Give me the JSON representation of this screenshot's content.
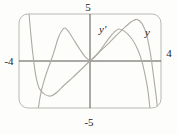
{
  "figure": {
    "viewing_window_text": {
      "top": "5",
      "bottom": "-5",
      "left": "-4",
      "right": "4"
    }
  },
  "chart_data": {
    "type": "line",
    "title": "",
    "xlabel": "",
    "ylabel": "",
    "window": {
      "xmin": -4,
      "xmax": 4,
      "ymin": -5,
      "ymax": 5
    },
    "grid": false,
    "legend_position": "inline-curve-labels",
    "axis_labels": {
      "top": "5",
      "bottom": "-5",
      "left": "-4",
      "right": "4"
    },
    "plot_px": {
      "left": 19,
      "top": 14,
      "right": 161,
      "bottom": 108,
      "radius": 9
    },
    "series": [
      {
        "name": "y",
        "label": "y",
        "role": "function",
        "features": "local minimum near (-2.2,-3.7), flat inflection at origin, local maximum near (2.65,4.4), steep fall at both window edges",
        "points": [
          [
            -3.45,
            5.4
          ],
          [
            -3.34,
            3.0
          ],
          [
            -3.22,
            0.8
          ],
          [
            -3.06,
            -1.5
          ],
          [
            -2.86,
            -2.9
          ],
          [
            -2.55,
            -3.55
          ],
          [
            -2.2,
            -3.72
          ],
          [
            -1.85,
            -3.3
          ],
          [
            -1.45,
            -2.55
          ],
          [
            -1.0,
            -1.8
          ],
          [
            -0.5,
            -0.9
          ],
          [
            0,
            0
          ],
          [
            0.5,
            0.9
          ],
          [
            1.0,
            1.8
          ],
          [
            1.5,
            2.75
          ],
          [
            2.0,
            3.65
          ],
          [
            2.35,
            4.2
          ],
          [
            2.65,
            4.42
          ],
          [
            2.95,
            3.9
          ],
          [
            3.2,
            2.7
          ],
          [
            3.42,
            0.6
          ],
          [
            3.58,
            -1.6
          ],
          [
            3.72,
            -3.6
          ],
          [
            3.82,
            -5.4
          ]
        ]
      },
      {
        "name": "y-prime",
        "label": "y'",
        "role": "derivative",
        "features": "zero at x=-2.2, local max near (-1.4,3.5), dip to ~0 at origin, local max near (1.6,3.4), zero near x=2.9, steep fall right side",
        "points": [
          [
            -2.94,
            -5.4
          ],
          [
            -2.8,
            -3.7
          ],
          [
            -2.62,
            -2.3
          ],
          [
            -2.4,
            -1.0
          ],
          [
            -2.2,
            0
          ],
          [
            -2.0,
            1.15
          ],
          [
            -1.78,
            2.5
          ],
          [
            -1.56,
            3.3
          ],
          [
            -1.4,
            3.5
          ],
          [
            -1.18,
            3.05
          ],
          [
            -0.88,
            2.15
          ],
          [
            -0.56,
            1.2
          ],
          [
            -0.26,
            0.42
          ],
          [
            0,
            0.1
          ],
          [
            0.3,
            0.5
          ],
          [
            0.64,
            1.3
          ],
          [
            1.0,
            2.25
          ],
          [
            1.35,
            3.05
          ],
          [
            1.62,
            3.4
          ],
          [
            1.95,
            3.15
          ],
          [
            2.3,
            2.5
          ],
          [
            2.6,
            1.6
          ],
          [
            2.85,
            0.4
          ],
          [
            3.05,
            -1.0
          ],
          [
            3.25,
            -3.0
          ],
          [
            3.4,
            -5.4
          ]
        ]
      }
    ],
    "colors": {
      "curve": "#aeaaa1",
      "axis": "#55554f",
      "border": "#b9b9b3",
      "label": "#1c1c1c",
      "background": "#fdfdfc"
    }
  }
}
